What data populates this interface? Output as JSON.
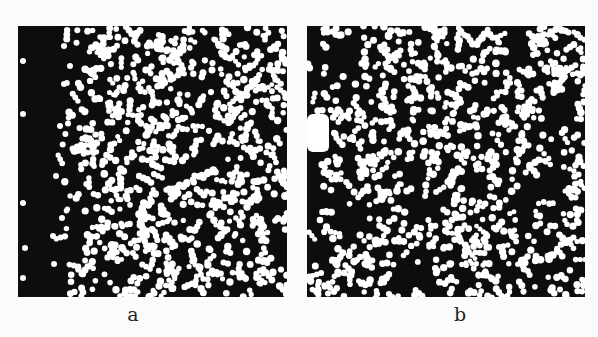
{
  "figure": {
    "panels": [
      {
        "id": "a",
        "label": "a",
        "box": {
          "x": 18,
          "y": 26,
          "w": 269,
          "h": 271
        },
        "label_pos": {
          "x": 113,
          "y": 305
        },
        "background": "#0d0d0d",
        "particle_color": "#ffffff",
        "description": "Binary image of white particles on black; left band (~40px wide) nearly empty with a few isolated particles; dense random particle field elsewhere",
        "seed": 7,
        "empty_band": {
          "x0": 0,
          "x1": 42,
          "sparse_to": 62
        },
        "sparse_dots": [
          [
            5,
            35
          ],
          [
            5,
            88
          ],
          [
            5,
            177
          ],
          [
            7,
            222
          ],
          [
            5,
            252
          ],
          [
            46,
            20
          ],
          [
            52,
            40
          ],
          [
            46,
            58
          ],
          [
            42,
            100
          ],
          [
            38,
            150
          ],
          [
            44,
            192
          ],
          [
            35,
            210
          ],
          [
            36,
            238
          ]
        ]
      },
      {
        "id": "b",
        "label": "b",
        "box": {
          "x": 307,
          "y": 26,
          "w": 278,
          "h": 271
        },
        "label_pos": {
          "x": 440,
          "y": 305
        },
        "background": "#0d0d0d",
        "particle_color": "#ffffff",
        "description": "Binary image of white particles on black with clustered, uneven distribution; large white blob at left edge, dark void patches",
        "seed": 19,
        "blob": {
          "x": 0,
          "y": 88,
          "w": 22,
          "h": 38
        },
        "dark_patches": [
          [
            20,
            10,
            34,
            48
          ],
          [
            0,
            0,
            16,
            240
          ],
          [
            222,
            145,
            40,
            30
          ],
          [
            235,
            70,
            28,
            30
          ],
          [
            25,
            170,
            45,
            40
          ],
          [
            80,
            240,
            50,
            25
          ]
        ]
      }
    ]
  }
}
